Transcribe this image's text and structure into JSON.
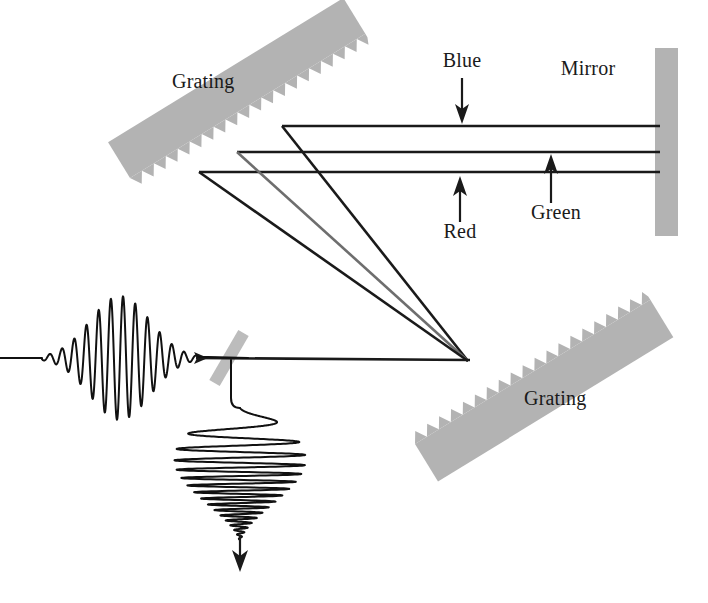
{
  "figure": {
    "type": "optics-schematic",
    "canvas": {
      "width": 708,
      "height": 603
    },
    "background_color": "#ffffff"
  },
  "colors": {
    "optic_gray": "#b3b3b3",
    "beam_black": "#1a1a1a",
    "beam_gray": "#6e6e6e",
    "label_text": "#1a1a1a",
    "splitter_gray": "#bcbcbc"
  },
  "labels": {
    "grating_top": "Grating",
    "grating_bottom": "Grating",
    "mirror": "Mirror",
    "blue": "Blue",
    "green": "Green",
    "red": "Red"
  },
  "components": [
    {
      "name": "grating-top",
      "kind": "diffraction-grating",
      "label": "Grating",
      "label_position": {
        "x": 172,
        "y": 88
      },
      "orientation": "tilted-up-right",
      "teeth_edge": "lower-right"
    },
    {
      "name": "grating-bottom",
      "kind": "diffraction-grating",
      "label": "Grating",
      "label_position": {
        "x": 524,
        "y": 405
      },
      "orientation": "tilted-up-right",
      "teeth_edge": "upper-left"
    },
    {
      "name": "mirror",
      "kind": "flat-mirror",
      "label": "Mirror",
      "label_position": {
        "x": 588,
        "y": 75
      },
      "orientation": "vertical"
    },
    {
      "name": "beamsplitter",
      "kind": "beam-splitter",
      "label": "",
      "orientation": "tilted"
    }
  ],
  "beams": {
    "spectral_rays": [
      {
        "name": "blue",
        "label": "Blue",
        "y": 126,
        "grating_x": 282
      },
      {
        "name": "green",
        "label": "Green",
        "y": 152,
        "grating_x": 237
      },
      {
        "name": "red",
        "label": "Red",
        "y": 172,
        "grating_x": 199
      }
    ],
    "convergence_point": {
      "x": 468,
      "y": 361
    },
    "mirror_plane_x": 656,
    "input_axis_y": 358
  },
  "callouts": [
    {
      "name": "blue",
      "text": "Blue",
      "text_x": 462,
      "text_y": 67,
      "arrow_from": {
        "x": 462,
        "y": 78
      },
      "arrow_to": {
        "x": 462,
        "y": 124
      },
      "direction": "down"
    },
    {
      "name": "red",
      "text": "Red",
      "text_x": 462,
      "text_y": 236,
      "arrow_from": {
        "x": 460,
        "y": 220
      },
      "arrow_to": {
        "x": 460,
        "y": 176
      },
      "direction": "up"
    },
    {
      "name": "green",
      "text": "Green",
      "text_x": 557,
      "text_y": 216,
      "arrow_from": {
        "x": 551,
        "y": 202
      },
      "arrow_to": {
        "x": 551,
        "y": 154
      },
      "direction": "up"
    }
  ],
  "waveforms": [
    {
      "name": "input-pulse",
      "description": "short transform-limited pulse entering the stretcher",
      "orientation": "horizontal",
      "center": {
        "x": 120,
        "y": 358
      },
      "envelope": "gaussian",
      "chirped": false
    },
    {
      "name": "output-chirped-pulse",
      "description": "stretched chirped pulse leaving the beam splitter downward",
      "orientation": "vertical",
      "center": {
        "x": 232,
        "y": 470
      },
      "envelope": "asymmetric",
      "chirped": true
    }
  ]
}
